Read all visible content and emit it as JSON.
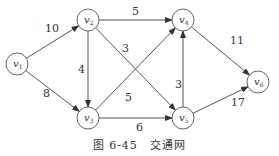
{
  "diagram": {
    "type": "directed-weighted-graph",
    "nodes": [
      {
        "id": "v1",
        "label": "v",
        "sub": "1",
        "x": 17,
        "y": 64
      },
      {
        "id": "v2",
        "label": "v",
        "sub": "2",
        "x": 88,
        "y": 20
      },
      {
        "id": "v3",
        "label": "v",
        "sub": "3",
        "x": 88,
        "y": 118
      },
      {
        "id": "v4",
        "label": "v",
        "sub": "4",
        "x": 183,
        "y": 20
      },
      {
        "id": "v5",
        "label": "v",
        "sub": "5",
        "x": 183,
        "y": 118
      },
      {
        "id": "v6",
        "label": "v",
        "sub": "6",
        "x": 258,
        "y": 82
      }
    ],
    "edges": [
      {
        "from": "v1",
        "to": "v2",
        "weight": "10"
      },
      {
        "from": "v1",
        "to": "v3",
        "weight": "8"
      },
      {
        "from": "v2",
        "to": "v4",
        "weight": "5"
      },
      {
        "from": "v2",
        "to": "v3",
        "weight": "4"
      },
      {
        "from": "v2",
        "to": "v5",
        "weight": "3"
      },
      {
        "from": "v3",
        "to": "v4",
        "weight": "5"
      },
      {
        "from": "v3",
        "to": "v5",
        "weight": "6"
      },
      {
        "from": "v5",
        "to": "v4",
        "weight": "3"
      },
      {
        "from": "v4",
        "to": "v6",
        "weight": "11"
      },
      {
        "from": "v5",
        "to": "v6",
        "weight": "17"
      }
    ]
  },
  "caption": {
    "figure": "图 6-45",
    "title": "交通网"
  }
}
